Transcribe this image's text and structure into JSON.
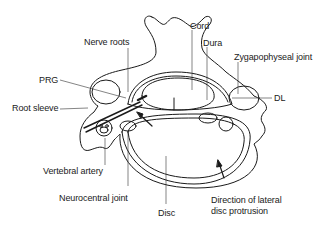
{
  "diagram": {
    "labels": {
      "nerve_roots": "Nerve roots",
      "cord": "Cord",
      "dura": "Dura",
      "zygapophyseal_joint": "Zygapophyseal joint",
      "prg": "PRG",
      "root_sleeve": "Root sleeve",
      "dl": "DL",
      "vertebral_artery": "Vertebral artery",
      "neurocentral_joint": "Neurocentral joint",
      "disc": "Disc",
      "direction_line1": "Direction of lateral",
      "direction_line2": "disc protrusion"
    },
    "colors": {
      "stroke": "#1a1a1a",
      "background": "#ffffff"
    }
  }
}
